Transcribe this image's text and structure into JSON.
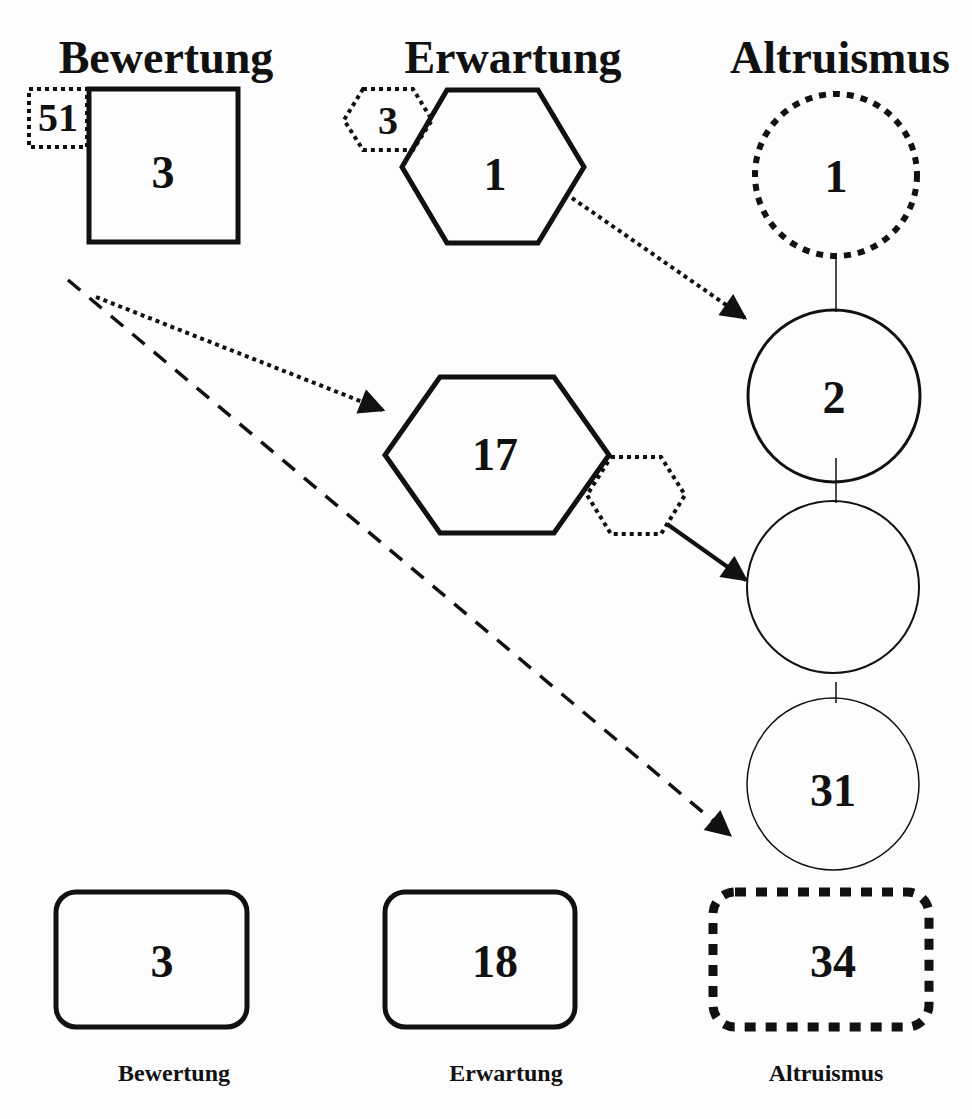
{
  "headers": [
    "Bewertung",
    "Erwartung",
    "Altruismus"
  ],
  "top_row": {
    "bewertung_square": {
      "value": "3",
      "badge": "51"
    },
    "erwartung_hexagon": {
      "value": "1",
      "badge": "3"
    },
    "altruismus_circle_dotted": {
      "value": "1"
    }
  },
  "middle": {
    "erwartung_hexagon": {
      "value": "17",
      "attached_dotted_hexagon": ""
    },
    "altruismus_circles": [
      {
        "value": "2"
      },
      {
        "value": ""
      },
      {
        "value": "31"
      }
    ]
  },
  "legend": [
    {
      "value": "3",
      "label": "Bewertung",
      "style": "solid rounded rectangle"
    },
    {
      "value": "18",
      "label": "Erwartung",
      "style": "solid rounded rectangle"
    },
    {
      "value": "34",
      "label": "Altruismus",
      "style": "dotted rounded rectangle"
    }
  ],
  "colors": {
    "stroke": "#111111",
    "background": "#fdfdfd"
  }
}
